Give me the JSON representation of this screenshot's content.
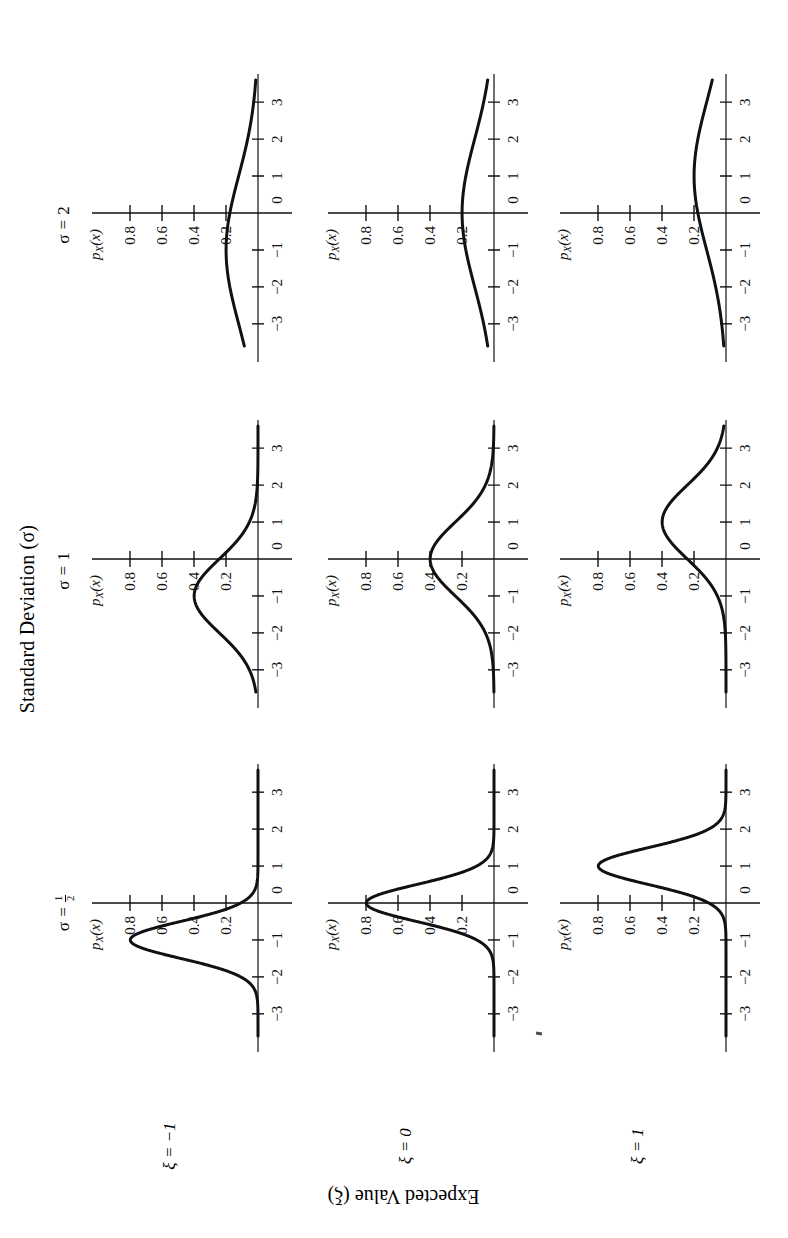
{
  "figure": {
    "top_title": "Standard Deviation (σ)",
    "side_title": "Expected Value (ξ)",
    "column_headers": [
      {
        "prefix": "σ = ",
        "value": "1/2",
        "is_fraction": true,
        "numerator": "1",
        "denominator": "2"
      },
      {
        "prefix": "σ = ",
        "value": "1",
        "is_fraction": false
      },
      {
        "prefix": "σ = ",
        "value": "2",
        "is_fraction": false
      }
    ],
    "row_headers": [
      {
        "prefix": "ξ = ",
        "value": "−1"
      },
      {
        "prefix": "ξ = ",
        "value": "0"
      },
      {
        "prefix": "ξ = ",
        "value": "1"
      }
    ],
    "axis": {
      "x_label": "x",
      "y_label": "p",
      "y_label_sub": "X",
      "y_label_arg": "(x)",
      "x_ticks": [
        "−3",
        "−2",
        "−1",
        "0",
        "1",
        "2",
        "3"
      ],
      "x_tick_values": [
        -3,
        -2,
        -1,
        0,
        1,
        2,
        3
      ],
      "y_ticks": [
        "0.2",
        "0.4",
        "0.6",
        "0.8"
      ],
      "y_tick_values": [
        0.2,
        0.4,
        0.6,
        0.8
      ],
      "x_range": [
        -3.6,
        3.6
      ],
      "y_range": [
        0,
        0.95
      ]
    }
  },
  "chart_data": {
    "type": "line",
    "xlabel": "x",
    "ylabel": "p_X(x)",
    "xlim": [
      -3.6,
      3.6
    ],
    "ylim": [
      0,
      0.95
    ],
    "grid": false,
    "legend": "none",
    "layout": {
      "rows": 3,
      "cols": 3,
      "row_variable": "ξ",
      "col_variable": "σ"
    },
    "x_tick_labels": [
      "−3",
      "−2",
      "−1",
      "0",
      "1",
      "2",
      "3"
    ],
    "y_tick_labels": [
      "0.2",
      "0.4",
      "0.6",
      "0.8"
    ],
    "panels": [
      {
        "row": 0,
        "col": 0,
        "xi": -1,
        "sigma": 0.5,
        "peak_x": -1,
        "peak_y": 0.7979,
        "label_xi": "ξ = −1",
        "label_sigma": "σ = 1/2",
        "x": [
          -3.5,
          -3,
          -2.5,
          -2,
          -1.5,
          -1,
          -0.5,
          0,
          0.5,
          1,
          1.5,
          2,
          2.5,
          3,
          3.5
        ],
        "y": [
          0.0,
          0.011,
          0.089,
          0.323,
          0.645,
          0.798,
          0.645,
          0.323,
          0.089,
          0.011,
          0.001,
          0.0,
          0.0,
          0.0,
          0.0
        ]
      },
      {
        "row": 0,
        "col": 1,
        "xi": -1,
        "sigma": 1,
        "peak_x": -1,
        "peak_y": 0.3989,
        "label_xi": "ξ = −1",
        "label_sigma": "σ = 1",
        "x": [
          -3.5,
          -3,
          -2.5,
          -2,
          -1.5,
          -1,
          -0.5,
          0,
          0.5,
          1,
          1.5,
          2,
          2.5,
          3,
          3.5
        ],
        "y": [
          0.018,
          0.054,
          0.13,
          0.242,
          0.352,
          0.399,
          0.352,
          0.242,
          0.13,
          0.054,
          0.018,
          0.004,
          0.001,
          0.0,
          0.0
        ]
      },
      {
        "row": 0,
        "col": 2,
        "xi": -1,
        "sigma": 2,
        "peak_x": -1,
        "peak_y": 0.1995,
        "label_xi": "ξ = −1",
        "label_sigma": "σ = 2",
        "x": [
          -3.5,
          -3,
          -2.5,
          -2,
          -1.5,
          -1,
          -0.5,
          0,
          0.5,
          1,
          1.5,
          2,
          2.5,
          3,
          3.5
        ],
        "y": [
          0.091,
          0.121,
          0.15,
          0.176,
          0.193,
          0.199,
          0.193,
          0.176,
          0.15,
          0.121,
          0.091,
          0.065,
          0.043,
          0.027,
          0.016
        ]
      },
      {
        "row": 1,
        "col": 0,
        "xi": 0,
        "sigma": 0.5,
        "peak_x": 0,
        "peak_y": 0.7979,
        "label_xi": "ξ = 0",
        "label_sigma": "σ = 1/2",
        "x": [
          -3.5,
          -3,
          -2.5,
          -2,
          -1.5,
          -1,
          -0.5,
          0,
          0.5,
          1,
          1.5,
          2,
          2.5,
          3,
          3.5
        ],
        "y": [
          0.0,
          0.0,
          0.0,
          0.001,
          0.011,
          0.108,
          0.484,
          0.798,
          0.484,
          0.108,
          0.011,
          0.001,
          0.0,
          0.0,
          0.0
        ]
      },
      {
        "row": 1,
        "col": 1,
        "xi": 0,
        "sigma": 1,
        "peak_x": 0,
        "peak_y": 0.3989,
        "label_xi": "ξ = 0",
        "label_sigma": "σ = 1",
        "x": [
          -3.5,
          -3,
          -2.5,
          -2,
          -1.5,
          -1,
          -0.5,
          0,
          0.5,
          1,
          1.5,
          2,
          2.5,
          3,
          3.5
        ],
        "y": [
          0.001,
          0.004,
          0.018,
          0.054,
          0.13,
          0.242,
          0.352,
          0.399,
          0.352,
          0.242,
          0.13,
          0.054,
          0.018,
          0.004,
          0.001
        ]
      },
      {
        "row": 1,
        "col": 2,
        "xi": 0,
        "sigma": 2,
        "peak_x": 0,
        "peak_y": 0.1995,
        "label_xi": "ξ = 0",
        "label_sigma": "σ = 2",
        "x": [
          -3.5,
          -3,
          -2.5,
          -2,
          -1.5,
          -1,
          -0.5,
          0,
          0.5,
          1,
          1.5,
          2,
          2.5,
          3,
          3.5
        ],
        "y": [
          0.043,
          0.065,
          0.091,
          0.121,
          0.15,
          0.176,
          0.193,
          0.199,
          0.193,
          0.176,
          0.15,
          0.121,
          0.091,
          0.065,
          0.043
        ]
      },
      {
        "row": 2,
        "col": 0,
        "xi": 1,
        "sigma": 0.5,
        "peak_x": 1,
        "peak_y": 0.7979,
        "label_xi": "ξ = 1",
        "label_sigma": "σ = 1/2",
        "x": [
          -3.5,
          -3,
          -2.5,
          -2,
          -1.5,
          -1,
          -0.5,
          0,
          0.5,
          1,
          1.5,
          2,
          2.5,
          3,
          3.5
        ],
        "y": [
          0.0,
          0.0,
          0.0,
          0.0,
          0.0,
          0.011,
          0.089,
          0.323,
          0.645,
          0.798,
          0.645,
          0.323,
          0.089,
          0.011,
          0.0
        ]
      },
      {
        "row": 2,
        "col": 1,
        "xi": 1,
        "sigma": 1,
        "peak_x": 1,
        "peak_y": 0.3989,
        "label_xi": "ξ = 1",
        "label_sigma": "σ = 1",
        "x": [
          -3.5,
          -3,
          -2.5,
          -2,
          -1.5,
          -1,
          -0.5,
          0,
          0.5,
          1,
          1.5,
          2,
          2.5,
          3,
          3.5
        ],
        "y": [
          0.0,
          0.0,
          0.001,
          0.004,
          0.018,
          0.054,
          0.13,
          0.242,
          0.352,
          0.399,
          0.352,
          0.242,
          0.13,
          0.054,
          0.018
        ]
      },
      {
        "row": 2,
        "col": 2,
        "xi": 1,
        "sigma": 2,
        "peak_x": 1,
        "peak_y": 0.1995,
        "label_xi": "ξ = 1",
        "label_sigma": "σ = 2",
        "x": [
          -3.5,
          -3,
          -2.5,
          -2,
          -1.5,
          -1,
          -0.5,
          0,
          0.5,
          1,
          1.5,
          2,
          2.5,
          3,
          3.5
        ],
        "y": [
          0.016,
          0.027,
          0.043,
          0.065,
          0.091,
          0.121,
          0.15,
          0.176,
          0.193,
          0.199,
          0.193,
          0.176,
          0.15,
          0.121,
          0.091
        ]
      }
    ],
    "annotated_curve_labels": [
      {
        "panel": 0,
        "text": "0.2"
      },
      {
        "panel": 1,
        "text": "0.2"
      },
      {
        "panel": 2,
        "text": "0.2"
      },
      {
        "panel": 3,
        "text": "0.2"
      },
      {
        "panel": 4,
        "text": "0.4"
      },
      {
        "panel": 5,
        "text": "0.2"
      },
      {
        "panel": 6,
        "text": "0.2"
      },
      {
        "panel": 7,
        "text": "0.4"
      },
      {
        "panel": 8,
        "text": "0.2"
      }
    ]
  }
}
